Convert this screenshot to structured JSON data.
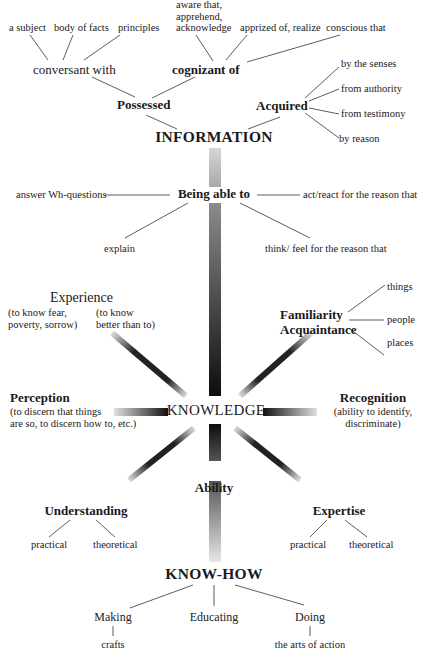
{
  "diagram": {
    "information": {
      "label": "INFORMATION",
      "possessed": {
        "label": "Possessed",
        "conversant": {
          "label": "conversant with",
          "objects": [
            "a subject",
            "body of facts",
            "principles"
          ]
        },
        "cognizant": {
          "label": "cognizant of",
          "synonyms": [
            "aware that,\napprehend,\nacknowledge",
            "apprized of, realize",
            "conscious that"
          ]
        }
      },
      "acquired": {
        "label": "Acquired",
        "sources": [
          "by the senses",
          "from authority",
          "from testimony",
          "by reason"
        ]
      }
    },
    "being_able_to": {
      "label": "Being able to",
      "items": [
        "answer Wh-questions",
        "act/react for the reason that",
        "explain",
        "think/ feel for the reason that"
      ]
    },
    "knowledge": {
      "label": "KNOWLEDGE",
      "experience": {
        "label": "Experience",
        "notes": [
          "(to know fear,\npoverty, sorrow)",
          "(to know\nbetter than to)"
        ]
      },
      "familiarity": {
        "label": "Familiarity\nAcquaintance",
        "objects": [
          "things",
          "people",
          "places"
        ]
      },
      "perception": {
        "label": "Perception",
        "note": "(to discern that things\nare so, to discern how to, etc.)"
      },
      "recognition": {
        "label": "Recognition",
        "note": "(ability to identify,\ndiscriminate)"
      },
      "understanding": {
        "label": "Understanding",
        "kinds": [
          "practical",
          "theoretical"
        ]
      },
      "expertise": {
        "label": "Expertise",
        "kinds": [
          "practical",
          "theoretical"
        ]
      }
    },
    "ability": {
      "label": "Ability"
    },
    "know_how": {
      "label": "KNOW-HOW",
      "making": {
        "label": "Making",
        "sub": "crafts"
      },
      "educating": {
        "label": "Educating"
      },
      "doing": {
        "label": "Doing",
        "sub": "the arts of action"
      }
    },
    "colors": {
      "text": "#1a1a1a",
      "line": "#333333",
      "bar_dark": "#111111",
      "bar_light": "#d8d8d8"
    }
  }
}
